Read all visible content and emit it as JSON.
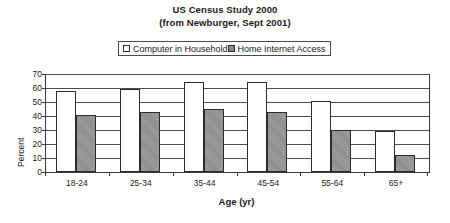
{
  "title": {
    "line1": "US Census Study 2000",
    "line2": "(from Newburger, Sept 2001)"
  },
  "legend": {
    "position": "top-center",
    "entries": [
      {
        "label": "Computer in Household",
        "color": "#ffffff"
      },
      {
        "label": "Home Internet Access",
        "color": "#8a8a8a"
      }
    ]
  },
  "axes": {
    "xlabel": "Age (yr)",
    "ylabel": "Percent"
  },
  "chart_data": {
    "type": "bar",
    "title": "US Census Study 2000 (from Newburger, Sept 2001)",
    "xlabel": "Age (yr)",
    "ylabel": "Percent",
    "ylim": [
      0,
      70
    ],
    "yticks": [
      0,
      10,
      20,
      30,
      40,
      50,
      60,
      70
    ],
    "grid": true,
    "legend_position": "top-center",
    "categories": [
      "18-24",
      "25-34",
      "35-44",
      "45-54",
      "55-64",
      "65+"
    ],
    "series": [
      {
        "name": "Computer in Household",
        "color": "#ffffff",
        "values": [
          58,
          59,
          64,
          64,
          51,
          29
        ]
      },
      {
        "name": "Home Internet Access",
        "color": "#8a8a8a",
        "values": [
          41,
          43,
          45,
          43,
          30,
          12
        ]
      }
    ]
  }
}
